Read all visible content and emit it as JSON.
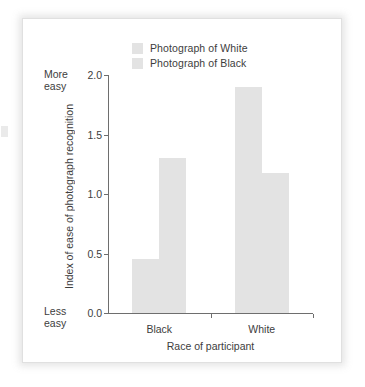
{
  "figure": {
    "legend": {
      "position": "top-center",
      "entries": [
        {
          "label": "Photograph of White",
          "color": "#e3e3e3"
        },
        {
          "label": "Photograph of Black",
          "color": "#e3e3e3"
        }
      ]
    },
    "annotations": {
      "axis_high": "More\neasy",
      "axis_high_line1": "More",
      "axis_high_line2": "easy",
      "axis_low_line1": "Less",
      "axis_low_line2": "easy"
    },
    "colors": {
      "bar_fill": "#e3e3e3",
      "axis": "#6e6e6e",
      "text": "#3d3d3d",
      "frame_border": "#e0e0e0",
      "page_background": "#ffffff"
    }
  },
  "chart_data": {
    "type": "bar",
    "title": "",
    "subtitle": "",
    "xlabel": "Race of participant",
    "ylabel": "Index of ease of photograph recognition",
    "categories": [
      "Black",
      "White"
    ],
    "series": [
      {
        "name": "Photograph of White",
        "values": [
          0.45,
          1.9
        ]
      },
      {
        "name": "Photograph of Black",
        "values": [
          1.3,
          1.18
        ]
      }
    ],
    "ylim": [
      0.0,
      2.0
    ],
    "yticks": [
      0.0,
      0.5,
      1.0,
      1.5,
      2.0
    ],
    "ytick_labels": [
      "0.0",
      "0.5",
      "1.0",
      "1.5",
      "2.0"
    ],
    "grid": false,
    "legend_position": "top-center",
    "y_axis_high_annotation": "More easy",
    "y_axis_low_annotation": "Less easy"
  }
}
